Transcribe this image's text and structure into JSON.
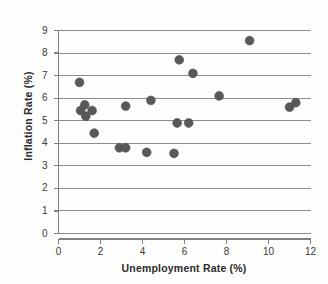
{
  "chart_data": {
    "type": "scatter",
    "title": "",
    "xlabel": "Unemployment Rate (%)",
    "ylabel": "Inflation Rate (%)",
    "xlim": [
      0,
      12
    ],
    "ylim": [
      0,
      9
    ],
    "xticks": [
      "0",
      "2",
      "4",
      "6",
      "8",
      "10",
      "12"
    ],
    "xtick_values": [
      0,
      2,
      4,
      6,
      8,
      10,
      12
    ],
    "yticks": [
      "0",
      "1",
      "2",
      "3",
      "4",
      "5",
      "6",
      "7",
      "8",
      "9"
    ],
    "ytick_values": [
      0,
      1,
      2,
      3,
      4,
      5,
      6,
      7,
      8,
      9
    ],
    "grid": "horizontal",
    "legend": "none",
    "marker_color": "#595959",
    "marker_size": 4.4,
    "axis_color": "#808080",
    "gridline_color": "#8c8c8c",
    "background_color": "#fdfdfc",
    "points": [
      {
        "x": 1.0,
        "y": 6.7
      },
      {
        "x": 1.05,
        "y": 5.45
      },
      {
        "x": 1.25,
        "y": 5.7
      },
      {
        "x": 1.3,
        "y": 5.2
      },
      {
        "x": 1.6,
        "y": 5.45
      },
      {
        "x": 1.7,
        "y": 4.45
      },
      {
        "x": 2.9,
        "y": 3.8
      },
      {
        "x": 3.2,
        "y": 3.8
      },
      {
        "x": 3.2,
        "y": 5.65
      },
      {
        "x": 4.2,
        "y": 3.6
      },
      {
        "x": 4.4,
        "y": 5.9
      },
      {
        "x": 5.5,
        "y": 3.55
      },
      {
        "x": 5.65,
        "y": 4.9
      },
      {
        "x": 5.75,
        "y": 7.7
      },
      {
        "x": 6.2,
        "y": 4.9
      },
      {
        "x": 6.4,
        "y": 7.1
      },
      {
        "x": 7.65,
        "y": 6.1
      },
      {
        "x": 9.1,
        "y": 8.55
      },
      {
        "x": 11.0,
        "y": 5.6
      },
      {
        "x": 11.3,
        "y": 5.8
      }
    ]
  }
}
